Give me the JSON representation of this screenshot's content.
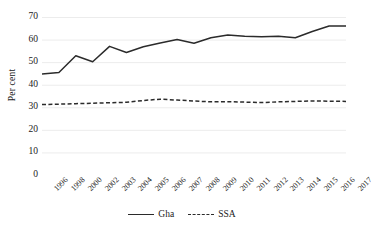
{
  "chart_data": {
    "type": "line",
    "title": "",
    "xlabel": "",
    "ylabel": "Per cent",
    "ylim": [
      0,
      70
    ],
    "ytick_step": 10,
    "yticks": [
      70,
      60,
      50,
      40,
      30,
      20,
      10,
      0
    ],
    "grid": true,
    "grid_axis": "y",
    "legend_position": "bottom",
    "categories": [
      "1996",
      "1998",
      "2000",
      "2002",
      "2003",
      "2004",
      "2005",
      "2006",
      "2007",
      "2008",
      "2009",
      "2010",
      "2011",
      "2012",
      "2013",
      "2014",
      "2015",
      "2016",
      "2017"
    ],
    "series": [
      {
        "name": "Gha",
        "style": "solid",
        "color": "#2b2b2b",
        "values": [
          44.8,
          45.4,
          52.8,
          50.2,
          57.0,
          54.3,
          56.8,
          58.5,
          60.0,
          58.4,
          60.8,
          62.0,
          61.5,
          61.2,
          61.5,
          60.8,
          63.6,
          66.0,
          66.0
        ]
      },
      {
        "name": "SSA",
        "style": "dashed",
        "color": "#2b2b2b",
        "values": [
          31.2,
          31.4,
          31.6,
          31.8,
          32.0,
          32.2,
          33.0,
          33.6,
          33.2,
          32.8,
          32.4,
          32.5,
          32.3,
          32.1,
          32.4,
          32.6,
          32.8,
          32.7,
          32.6
        ]
      }
    ]
  },
  "axes": {
    "y_title": "Per cent",
    "y_tick_labels": [
      "70",
      "60",
      "50",
      "40",
      "30",
      "20",
      "10",
      "0"
    ],
    "x_tick_labels": [
      "1996",
      "1998",
      "2000",
      "2002",
      "2003",
      "2004",
      "2005",
      "2006",
      "2007",
      "2008",
      "2009",
      "2010",
      "2011",
      "2012",
      "2013",
      "2014",
      "2015",
      "2016",
      "2017"
    ]
  },
  "legend": {
    "items": [
      {
        "label": "Gha",
        "style": "solid"
      },
      {
        "label": "SSA",
        "style": "dashed"
      }
    ]
  },
  "colors": {
    "line": "#2b2b2b",
    "grid": "#ececec",
    "background": "#ffffff",
    "text": "#1a1a1a"
  }
}
